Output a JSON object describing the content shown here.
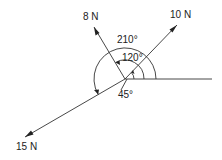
{
  "diagram": {
    "type": "force-vector-diagram",
    "origin": {
      "x": 125,
      "y": 79
    },
    "reference_line": {
      "x2": 212,
      "y2": 79
    },
    "forces": [
      {
        "label": "10 N",
        "magnitude": 10,
        "unit": "N",
        "angle_deg": 45,
        "end": {
          "x": 177,
          "y": 25
        },
        "label_pos": {
          "x": 170,
          "y": 18
        }
      },
      {
        "label": "8 N",
        "magnitude": 8,
        "unit": "N",
        "angle_deg": 120,
        "end": {
          "x": 94,
          "y": 27
        },
        "label_pos": {
          "x": 83,
          "y": 20
        }
      },
      {
        "label": "15 N",
        "magnitude": 15,
        "unit": "N",
        "angle_deg": 210,
        "end": {
          "x": 25,
          "y": 137
        },
        "label_pos": {
          "x": 16,
          "y": 150
        }
      }
    ],
    "angles": [
      {
        "label": "45°",
        "value_deg": 45,
        "radius": 9,
        "label_pos": {
          "x": 118,
          "y": 98
        }
      },
      {
        "label": "120°",
        "value_deg": 120,
        "radius": 19,
        "label_pos": {
          "x": 122,
          "y": 61
        }
      },
      {
        "label": "210°",
        "value_deg": 210,
        "radius": 31,
        "label_pos": {
          "x": 117,
          "y": 43
        }
      }
    ],
    "colors": {
      "line": "#333333",
      "text": "#222222",
      "background": "#ffffff"
    }
  }
}
